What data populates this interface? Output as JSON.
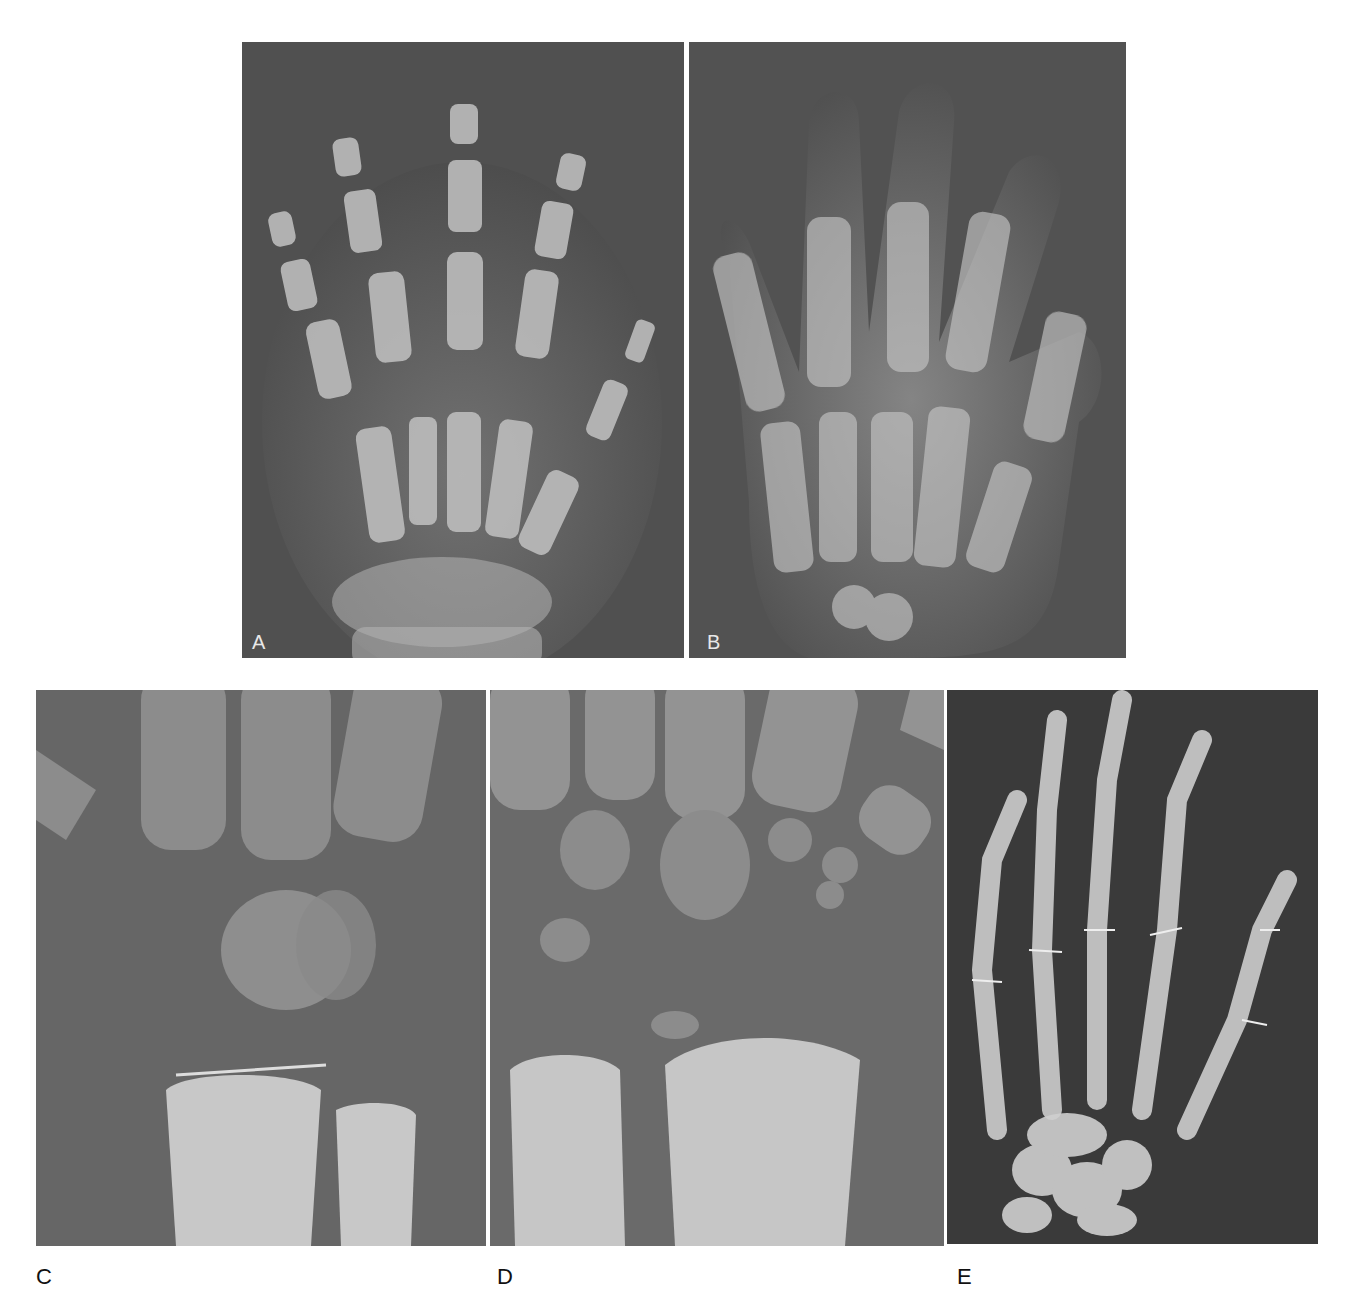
{
  "figure": {
    "panels": [
      {
        "id": "A",
        "label": "A",
        "description": "Hand radiograph, child, with growth plates"
      },
      {
        "id": "B",
        "label": "B",
        "description": "Hand radiograph, child, broad soft tissue"
      },
      {
        "id": "C",
        "label": "C",
        "description": "Wrist radiograph close-up, carpal ossification"
      },
      {
        "id": "D",
        "label": "D",
        "description": "Wrist radiograph close-up, carpals and distal radius"
      },
      {
        "id": "E",
        "label": "E",
        "description": "Hand radiograph, adolescent, high contrast"
      }
    ],
    "colors": {
      "background": "#ffffff",
      "film_dark": "#3e3e3e",
      "film_mid": "#6a6a6a",
      "bone": "#d8d8d8",
      "label_text": "#111111",
      "inset_label": "#e8e8e8"
    }
  }
}
